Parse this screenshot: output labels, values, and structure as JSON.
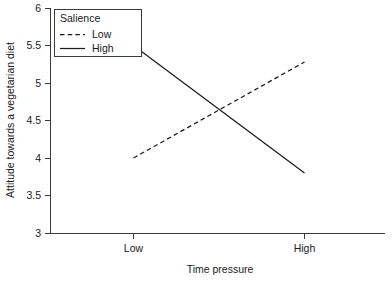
{
  "chart_data": {
    "type": "line",
    "title": "",
    "xlabel": "Time pressure",
    "ylabel": "Attitude towards a vegetarian diet",
    "categories": [
      "Low",
      "High"
    ],
    "x_tick_labels": [
      "Low",
      "High"
    ],
    "y_tick_labels": [
      "3",
      "3.5",
      "4",
      "4.5",
      "5",
      "5.5",
      "6"
    ],
    "y_ticks": [
      3,
      3.5,
      4,
      4.5,
      5,
      5.5,
      6
    ],
    "ylim": [
      3,
      6
    ],
    "grid": false,
    "legend_position": "top-left",
    "legend_title": "Salience",
    "series": [
      {
        "name": "Low",
        "style": "dashed",
        "color": "#1a1a1a",
        "values": [
          4.0,
          5.28
        ]
      },
      {
        "name": "High",
        "style": "solid",
        "color": "#1a1a1a",
        "values": [
          5.5,
          3.8
        ]
      }
    ]
  },
  "axes": {
    "y_title": "Attitude towards a vegetarian diet",
    "x_title": "Time pressure",
    "y_labels": {
      "t6": "6",
      "t55": "5.5",
      "t5": "5",
      "t45": "4.5",
      "t4": "4",
      "t35": "3.5",
      "t3": "3"
    },
    "x_labels": {
      "low": "Low",
      "high": "High"
    }
  },
  "legend": {
    "title": "Salience",
    "items": [
      {
        "label": "Low",
        "style": "dashed"
      },
      {
        "label": "High",
        "style": "solid"
      }
    ]
  },
  "colors": {
    "line": "#1a1a1a",
    "axis": "#3b3b3b",
    "background": "#ffffff"
  }
}
